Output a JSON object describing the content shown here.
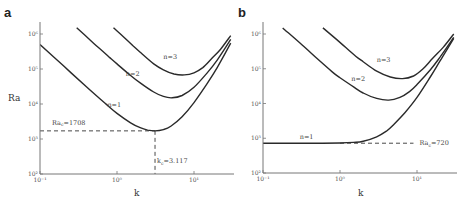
{
  "chart_data": [
    {
      "type": "line",
      "panel_label": "a",
      "xlabel": "k",
      "ylabel": "Ra",
      "xscale": "log",
      "yscale": "log",
      "xlim": [
        0.1,
        30
      ],
      "ylim": [
        100,
        1500000
      ],
      "xticks": [
        0.1,
        1,
        10
      ],
      "xtick_labels": [
        "10⁻¹",
        "10⁰",
        "10¹"
      ],
      "yticks": [
        100,
        1000,
        10000,
        100000,
        1000000
      ],
      "ytick_labels": [
        "10²",
        "10³",
        "10⁴",
        "10⁵",
        "10⁶"
      ],
      "grid": false,
      "series": [
        {
          "name": "n=1",
          "label_pos": {
            "k": 0.75,
            "Ra": 8000
          },
          "x": [
            0.1,
            0.2,
            0.4,
            0.7,
            1.0,
            1.5,
            2.0,
            2.5,
            3.117,
            4.0,
            5.0,
            7.0,
            10.0,
            15.0,
            20.0,
            30.0
          ],
          "y": [
            500000,
            125000,
            31000,
            10500,
            5400,
            2900,
            2100,
            1800,
            1708,
            1850,
            2300,
            4300,
            11000,
            40000,
            110000,
            550000
          ]
        },
        {
          "name": "n=2",
          "label_pos": {
            "k": 1.3,
            "Ra": 62000
          },
          "x": [
            0.3,
            0.5,
            0.8,
            1.0,
            1.5,
            2.0,
            3.0,
            4.0,
            5.2,
            7.0,
            10.0,
            15.0,
            20.0,
            30.0
          ],
          "y": [
            1500000,
            540000,
            215000,
            140000,
            65000,
            40000,
            22000,
            16500,
            15000,
            17500,
            30000,
            80000,
            180000,
            700000
          ]
        },
        {
          "name": "n=3",
          "label_pos": {
            "k": 4.0,
            "Ra": 190000
          },
          "x": [
            0.9,
            1.2,
            1.6,
            2.0,
            3.0,
            4.0,
            5.5,
            7.5,
            10.0,
            13.0,
            17.0,
            22.0,
            30.0
          ],
          "y": [
            1500000,
            850000,
            470000,
            300000,
            140000,
            95000,
            72000,
            68000,
            78000,
            110000,
            200000,
            360000,
            900000
          ]
        }
      ],
      "annotations": [
        {
          "text": "Ra_c=1708",
          "display": "Ra",
          "sub": "c",
          "value": "=1708",
          "type": "hline-dashed",
          "Ra": 1708,
          "k_from": 0.1,
          "k_to": 3.117
        },
        {
          "text": "k_c=3.117",
          "display": "k",
          "sub": "c",
          "value": "=3.117",
          "type": "vline-dashed",
          "k": 3.117,
          "Ra_from": 100,
          "Ra_to": 1708
        }
      ]
    },
    {
      "type": "line",
      "panel_label": "b",
      "xlabel": "k",
      "ylabel": "",
      "xscale": "log",
      "yscale": "log",
      "xlim": [
        0.1,
        30
      ],
      "ylim": [
        100,
        1500000
      ],
      "xticks": [
        0.1,
        1,
        10
      ],
      "xtick_labels": [
        "10⁻¹",
        "10⁰",
        "10¹"
      ],
      "yticks": [
        100,
        1000,
        10000,
        100000,
        1000000
      ],
      "ytick_labels": [
        "10²",
        "10³",
        "10⁴",
        "10⁵",
        "10⁶"
      ],
      "grid": false,
      "series": [
        {
          "name": "n=1",
          "label_pos": {
            "k": 0.3,
            "Ra": 950
          },
          "x": [
            0.1,
            0.3,
            0.6,
            1.0,
            1.5,
            2.0,
            3.0,
            4.0,
            5.0,
            7.0,
            10.0,
            15.0,
            20.0,
            30.0
          ],
          "y": [
            720,
            720,
            722,
            730,
            760,
            820,
            1100,
            1600,
            2500,
            5500,
            15000,
            60000,
            170000,
            750000
          ]
        },
        {
          "name": "n=2",
          "label_pos": {
            "k": 1.4,
            "Ra": 44000
          },
          "x": [
            0.18,
            0.3,
            0.5,
            0.8,
            1.0,
            1.5,
            2.0,
            3.0,
            4.3,
            6.0,
            8.0,
            10.0,
            15.0,
            20.0,
            30.0
          ],
          "y": [
            1500000,
            560000,
            200000,
            80000,
            55000,
            30000,
            20000,
            14000,
            12500,
            15000,
            22000,
            35000,
            95000,
            220000,
            800000
          ]
        },
        {
          "name": "n=3",
          "label_pos": {
            "k": 3.0,
            "Ra": 160000
          },
          "x": [
            0.6,
            0.9,
            1.2,
            1.6,
            2.0,
            3.0,
            4.5,
            6.5,
            9.0,
            12.0,
            16.0,
            22.0,
            30.0
          ],
          "y": [
            1500000,
            700000,
            400000,
            230000,
            160000,
            85000,
            58000,
            52000,
            62000,
            100000,
            200000,
            420000,
            1000000
          ]
        }
      ],
      "annotations": [
        {
          "text": "Ra_c=720",
          "display": "Ra",
          "sub": "c",
          "value": "=720",
          "type": "hline-dashed",
          "Ra": 720,
          "k_from": 1.0,
          "k_to": 9.0
        }
      ]
    }
  ]
}
